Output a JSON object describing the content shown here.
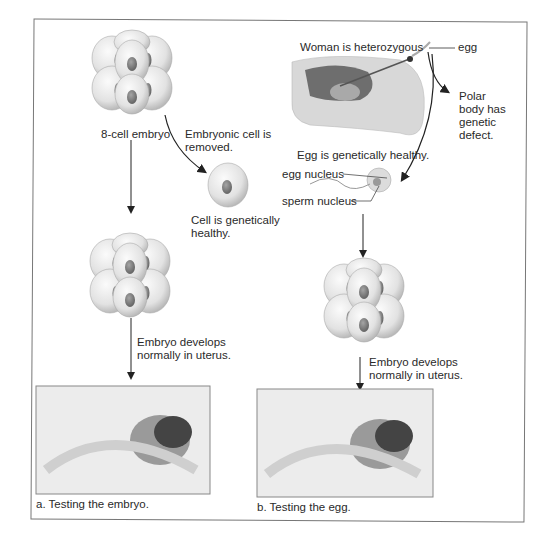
{
  "figure": {
    "panel_a": {
      "caption": "a. Testing the embryo.",
      "labels": {
        "eight_cell": "8-cell embryo",
        "cell_removed": "Embryonic cell is removed.",
        "cell_healthy": "Cell is genetically healthy.",
        "develops": "Embryo develops normally in uterus."
      }
    },
    "panel_b": {
      "caption": "b. Testing the egg.",
      "labels": {
        "woman": "Woman is heterozygous",
        "egg": "egg",
        "polar": "Polar body has genetic defect.",
        "egg_healthy": "Egg is genetically healthy.",
        "egg_nucleus": "egg nucleus",
        "sperm_nucleus": "sperm nucleus",
        "develops": "Embryo develops normally in uterus."
      }
    },
    "colors": {
      "frame": "#777777",
      "cell_fill": "#e6e6e6",
      "cell_shade": "#b5b5b5",
      "nucleus": "#7a7a7a",
      "arrow": "#222222",
      "photo_bg": "#e9e9e9"
    }
  }
}
